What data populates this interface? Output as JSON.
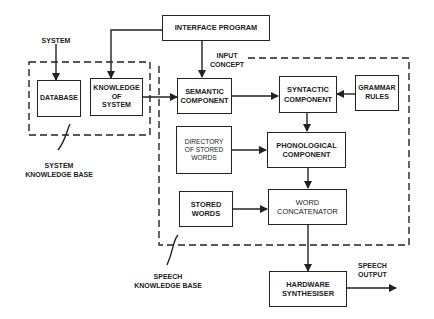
{
  "diagram": {
    "boxes": {
      "interface_program": "INTERFACE PROGRAM",
      "database": "DATABASE",
      "knowledge_of_system": "KNOWLEDGE\nOF\nSYSTEM",
      "semantic_component": "SEMANTIC\nCOMPONENT",
      "syntactic_component": "SYNTACTIC\nCOMPONENT",
      "grammar_rules": "GRAMMAR\nRULES",
      "directory_of_stored_words": "DIRECTORY\nOF STORED\nWORDS",
      "phonological_component": "PHONOLOGICAL\nCOMPONENT",
      "stored_words": "STORED\nWORDS",
      "word_concatenator": "WORD\nCONCATENATOR",
      "hardware_synthesiser": "HARDWARE\nSYNTHESISER"
    },
    "labels": {
      "system": "SYSTEM",
      "input_concept": "INPUT\nCONCEPT",
      "system_knowledge_base": "SYSTEM\nKNOWLEDGE BASE",
      "speech_knowledge_base": "SPEECH\nKNOWLEDGE BASE",
      "speech_output": "SPEECH\nOUTPUT"
    }
  }
}
